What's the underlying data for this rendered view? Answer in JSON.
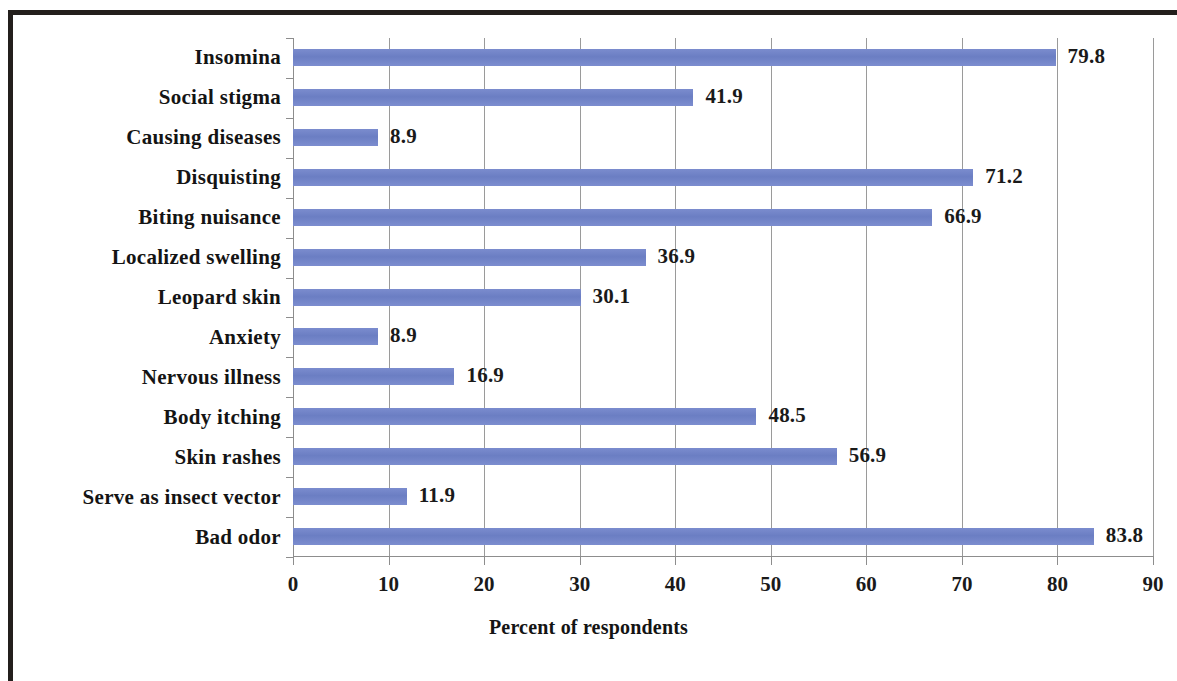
{
  "chart_data": {
    "type": "bar",
    "orientation": "horizontal",
    "title": "",
    "xlabel": "Percent of respondents",
    "ylabel": "",
    "xlim": [
      0,
      90
    ],
    "xticks": [
      0,
      10,
      20,
      30,
      40,
      50,
      60,
      70,
      80,
      90
    ],
    "xtick_labels": [
      "0",
      "10",
      "20",
      "30",
      "40",
      "50",
      "60",
      "70",
      "80",
      "90"
    ],
    "grid": "vertical",
    "legend": "none",
    "bar_color": "#6f82c6",
    "categories": [
      "Insomina",
      "Social  stigma",
      "Causing  diseases",
      "Disquisting",
      "Biting  nuisance",
      "Localized  swelling",
      "Leopard  skin",
      "Anxiety",
      "Nervous  illness",
      "Body  itching",
      "Skin  rashes",
      "Serve  as  insect  vector",
      "Bad  odor"
    ],
    "values": [
      79.8,
      41.9,
      8.9,
      71.2,
      66.9,
      36.9,
      30.1,
      8.9,
      16.9,
      48.5,
      56.9,
      11.9,
      83.8
    ],
    "value_labels": [
      "79.8",
      "41.9",
      "8.9",
      "71.2",
      "66.9",
      "36.9",
      "30.1",
      "8.9",
      "16.9",
      "48.5",
      "56.9",
      "11.9",
      "83.8"
    ]
  }
}
